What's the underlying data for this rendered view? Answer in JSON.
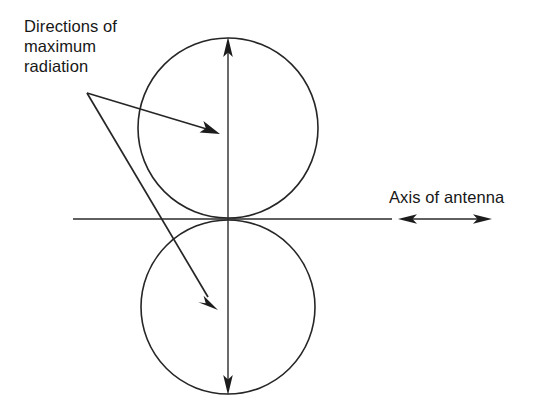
{
  "figure": {
    "title_annotation": "Directions of maximum radiation",
    "annotations": {
      "max_radiation": {
        "line1": "Directions of",
        "line2": "maximum",
        "line3": "radiation"
      },
      "axis_of_antenna": "Axis of antenna"
    },
    "colors": {
      "background": "#ffffff",
      "stroke": "#262626",
      "text": "#171717"
    },
    "geometry": {
      "upper_circle": {
        "cx": 228,
        "cy": 128,
        "r": 90
      },
      "lower_circle": {
        "cx": 228,
        "cy": 307,
        "r": 87
      },
      "horizontal_axis": {
        "x1": 73,
        "y1": 219,
        "x2": 392,
        "y2": 219
      },
      "vertical_axis": {
        "x": 228,
        "y_top": 38,
        "y_bottom": 394
      },
      "axis_arrow": {
        "x1": 400,
        "x2": 490,
        "y": 219
      },
      "leader_origin": {
        "x": 87,
        "y": 93
      },
      "leader_tip_upper": {
        "x": 219,
        "y": 134
      },
      "leader_tip_lower": {
        "x": 218,
        "y": 308
      }
    }
  }
}
